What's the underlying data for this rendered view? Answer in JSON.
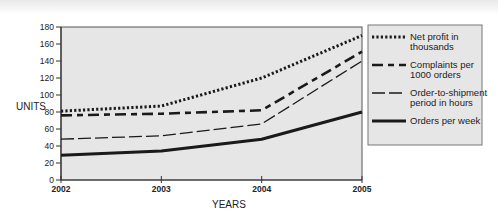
{
  "chart_data": {
    "type": "line",
    "title": "",
    "xlabel": "YEARS",
    "ylabel": "UNITS",
    "x": [
      "2002",
      "2003",
      "2004",
      "2005"
    ],
    "ylim": [
      0,
      180
    ],
    "yticks": [
      0,
      20,
      40,
      60,
      80,
      100,
      120,
      140,
      160,
      180
    ],
    "grid": false,
    "legend_position": "right",
    "series": [
      {
        "name": "Net profit in thousands",
        "legend_lines": [
          "Net profit in",
          "thousands"
        ],
        "style": "dotted",
        "values": [
          81,
          87,
          120,
          170
        ]
      },
      {
        "name": "Complaints per 1000 orders",
        "legend_lines": [
          "Complaints per",
          "1000 orders"
        ],
        "style": "dash-heavy",
        "values": [
          76,
          78,
          82,
          151
        ]
      },
      {
        "name": "Order-to-shipment period in hours",
        "legend_lines": [
          "Order-to-shipment",
          "period in hours"
        ],
        "style": "dash-long",
        "values": [
          48,
          52,
          66,
          140
        ]
      },
      {
        "name": "Orders per week",
        "legend_lines": [
          "Orders per week"
        ],
        "style": "solid",
        "values": [
          29,
          34,
          48,
          80
        ]
      }
    ]
  },
  "colors": {
    "plot_background": "#e6e6e6",
    "legend_background": "#e6e6e6",
    "line": "#1a1a1a",
    "axis": "#555555"
  }
}
